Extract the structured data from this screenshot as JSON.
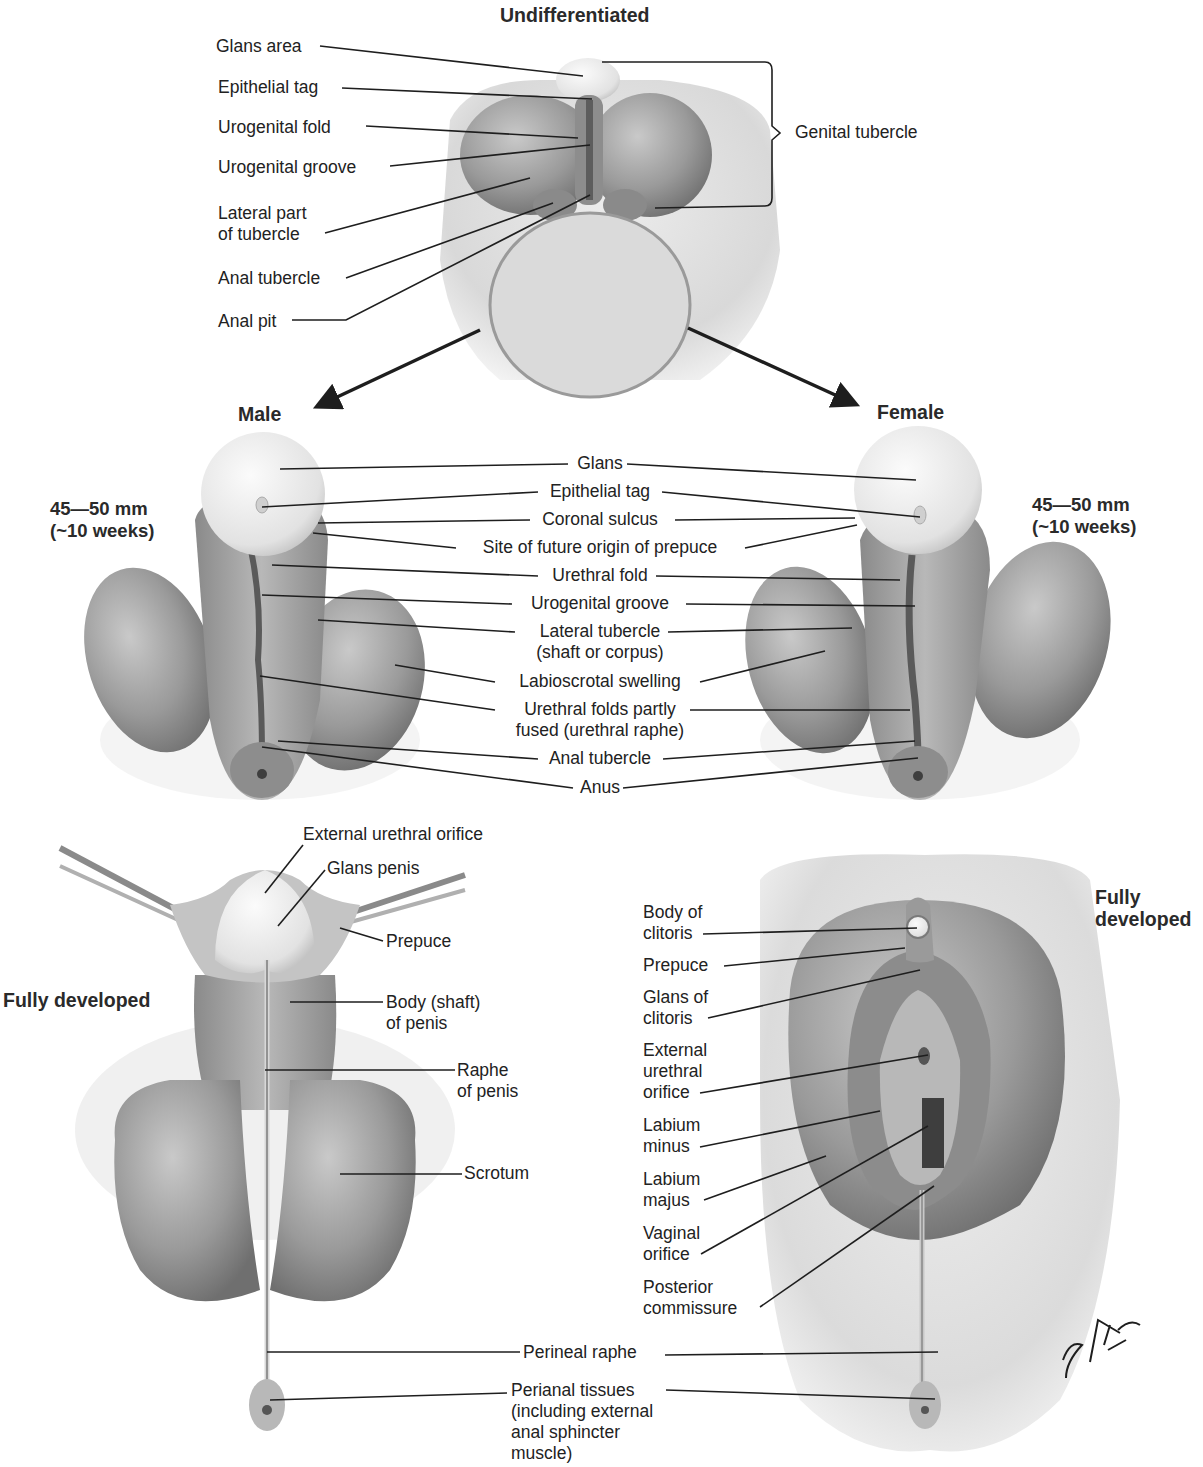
{
  "figure": {
    "signature": "F. Netter M.D.",
    "colors": {
      "ink": "#1e1e1e",
      "tissue_dark": "#6e6e6e",
      "tissue_mid": "#9a9a9a",
      "tissue_light": "#c8c8c8",
      "glans": "#ececec",
      "background": "#ffffff"
    }
  },
  "undifferentiated": {
    "heading": "Undifferentiated",
    "labels": [
      "Glans area",
      "Epithelial tag",
      "Urogenital fold",
      "Urogenital groove",
      "Lateral part\nof tubercle",
      "Anal tubercle",
      "Anal pit"
    ],
    "bracket_label": "Genital tubercle"
  },
  "stage_10wk": {
    "male_heading": "Male",
    "female_heading": "Female",
    "male_size": "45—50 mm\n(~10 weeks)",
    "female_size": "45—50 mm\n(~10 weeks)",
    "shared_labels": [
      "Glans",
      "Epithelial tag",
      "Coronal sulcus",
      "Site of future origin of prepuce",
      "Urethral fold",
      "Urogenital groove",
      "Lateral tubercle\n(shaft or corpus)",
      "Labioscrotal swelling",
      "Urethral folds partly\nfused (urethral raphe)",
      "Anal tubercle",
      "Anus"
    ]
  },
  "male_developed": {
    "heading": "Fully developed",
    "labels": [
      "External urethral orifice",
      "Glans penis",
      "Prepuce",
      "Body (shaft)\nof penis",
      "Raphe\nof penis",
      "Scrotum"
    ]
  },
  "female_developed": {
    "heading": "Fully\ndeveloped",
    "labels": [
      "Body of\nclitoris",
      "Prepuce",
      "Glans of\nclitoris",
      "External\nurethral\norifice",
      "Labium\nminus",
      "Labium\nmajus",
      "Vaginal\norifice",
      "Posterior\ncommissure"
    ]
  },
  "shared_bottom": {
    "labels": [
      "Perineal raphe",
      "Perianal tissues\n(including external\nanal sphincter\nmuscle)"
    ]
  }
}
